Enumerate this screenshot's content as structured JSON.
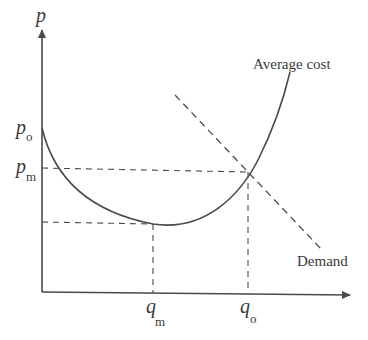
{
  "diagram": {
    "title": "",
    "type": "economics-average-cost-vs-demand",
    "colors": {
      "line": "#4a4a4a",
      "text": "#3a3a3a",
      "background": "#ffffff"
    },
    "axes": {
      "y_label": "p",
      "x_label": ""
    },
    "price_labels": {
      "p_o": {
        "base": "p",
        "sub": "o"
      },
      "p_m": {
        "base": "p",
        "sub": "m"
      }
    },
    "quantity_labels": {
      "q_m": {
        "base": "q",
        "sub": "m"
      },
      "q_o": {
        "base": "q",
        "sub": "o"
      }
    },
    "curves": {
      "average_cost": {
        "label": "Average cost",
        "style": "solid"
      },
      "demand": {
        "label": "Demand",
        "style": "dashed"
      }
    },
    "guides": [
      {
        "name": "p_m-guide",
        "style": "dashed",
        "from": "y-axis",
        "to": "intersection of Average cost and Demand"
      },
      {
        "name": "min-ac-guide",
        "style": "dashed",
        "from": "y-axis",
        "to": "minimum of Average cost"
      },
      {
        "name": "q_m-guide",
        "style": "dashed",
        "from": "minimum of Average cost",
        "to": "x-axis"
      },
      {
        "name": "q_o-guide",
        "style": "dashed",
        "from": "intersection",
        "to": "x-axis"
      }
    ]
  }
}
